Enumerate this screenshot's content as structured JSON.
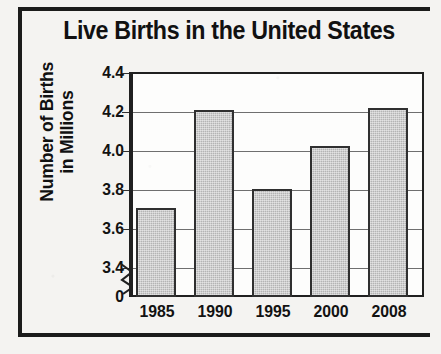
{
  "chart_data": {
    "type": "bar",
    "title": "Live Births in the United States",
    "xlabel": "",
    "ylabel_lines": [
      "Number of Births",
      "in Millions"
    ],
    "ylabel": "Number of Births in Millions",
    "categories": [
      "1985",
      "1990",
      "1995",
      "2000",
      "2008"
    ],
    "values": [
      3.7,
      4.21,
      3.8,
      4.02,
      4.22
    ],
    "ytick_labels": [
      "4.4",
      "4.2",
      "4.0",
      "3.8",
      "3.6",
      "3.4",
      "0"
    ],
    "ytick_values": [
      4.4,
      4.2,
      4.0,
      3.8,
      3.6,
      3.4,
      0
    ],
    "ylim": [
      3.4,
      4.4
    ],
    "axis_break": true,
    "axis_break_between": [
      "3.4",
      "0"
    ],
    "grid": true,
    "legend": "none",
    "bar_fill_color": "#b4b4b4",
    "bar_edge_color": "#303030",
    "plot_background": "#fdfdfc",
    "text_color": "#111111",
    "frame_color": "#1b1b1b"
  },
  "figure": {
    "title": "Live Births in the United States",
    "y_axis_title_line1": "Number of Births",
    "y_axis_title_line2": "in Millions"
  }
}
